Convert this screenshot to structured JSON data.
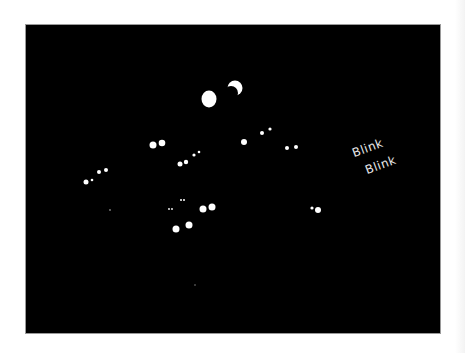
{
  "illustration": {
    "caption_lines": [
      "Blink",
      "Blink"
    ],
    "background_color": "#000000",
    "page_color": "#ffffff",
    "eye_color": "#ffffff",
    "text_color": "#e8e8e8",
    "moon": {
      "full": {
        "cx": 183,
        "cy": 74,
        "rx": 7.5,
        "ry": 8.5
      },
      "crescent": {
        "cx": 209,
        "cy": 63,
        "r": 7.5
      }
    },
    "eye_pairs": [
      {
        "left": [
          127,
          120,
          3.5
        ],
        "right": [
          136,
          118,
          3.3
        ]
      },
      {
        "left": [
          154,
          139,
          2.5
        ],
        "right": [
          160,
          137,
          2.2
        ]
      },
      {
        "left": [
          168,
          130,
          1.6
        ],
        "right": [
          173,
          127,
          1.3
        ]
      },
      {
        "left": [
          60,
          157,
          2.5
        ],
        "right": [
          66,
          155,
          1.3
        ]
      },
      {
        "left": [
          73,
          147,
          2
        ],
        "right": [
          80,
          145,
          2
        ]
      },
      {
        "left": [
          143,
          184,
          0.9
        ],
        "right": [
          146,
          184,
          0.9
        ]
      },
      {
        "left": [
          155,
          175,
          1
        ],
        "right": [
          158,
          175,
          1
        ]
      },
      {
        "left": [
          177,
          184,
          3.5
        ],
        "right": [
          186,
          182,
          3.5
        ]
      },
      {
        "left": [
          150,
          204,
          3.5
        ],
        "right": [
          163,
          200,
          3.5
        ]
      },
      {
        "left": [
          218,
          117,
          3
        ],
        "right": null
      },
      {
        "left": [
          236,
          108,
          2
        ],
        "right": [
          244,
          104,
          1.6
        ]
      },
      {
        "left": [
          261,
          123,
          2
        ],
        "right": [
          270,
          122,
          2
        ]
      },
      {
        "left": [
          286,
          183,
          1.6
        ],
        "right": [
          292,
          185,
          3
        ]
      }
    ],
    "faint_dots": [
      [
        84,
        185,
        0.9
      ],
      [
        169,
        260,
        0.8
      ]
    ]
  }
}
